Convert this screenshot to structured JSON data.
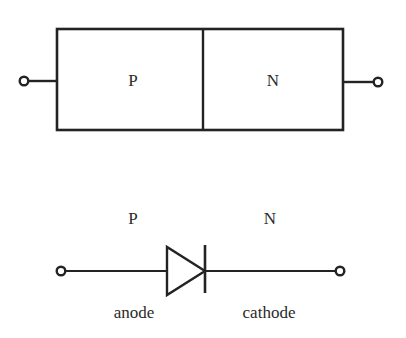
{
  "figure": {
    "background_color": "#ffffff",
    "line_color": "#232323",
    "text_color": "#2a2a2a",
    "width": 406,
    "height": 338
  },
  "structure_diagram": {
    "name": "pn-junction-block",
    "box": {
      "x": 57,
      "y": 29,
      "width": 286,
      "height": 101
    },
    "junction_line_x": 203,
    "left_region_label": "P",
    "right_region_label": "N",
    "left_terminal": {
      "cx": 24,
      "cy": 81,
      "r": 4.5
    },
    "right_terminal": {
      "cx": 378,
      "cy": 82,
      "r": 4.5
    },
    "lead_y_left": 81,
    "lead_y_right": 82
  },
  "symbol_diagram": {
    "name": "diode-symbol",
    "wire_y": 271,
    "left_terminal": {
      "cx": 61,
      "cy": 271,
      "r": 4.5
    },
    "right_terminal": {
      "cx": 340,
      "cy": 271,
      "r": 4.5
    },
    "triangle": {
      "x_back": 167,
      "x_apex": 205,
      "y_top": 247,
      "y_bottom": 295
    },
    "cathode_bar": {
      "x": 205,
      "y_top": 245,
      "y_bottom": 293
    },
    "p_label": "P",
    "n_label": "N",
    "p_label_pos": {
      "x": 133,
      "y": 224
    },
    "n_label_pos": {
      "x": 270,
      "y": 224
    },
    "anode_label": "anode",
    "cathode_label": "cathode",
    "anode_label_pos": {
      "x": 134,
      "y": 318
    },
    "cathode_label_pos": {
      "x": 269,
      "y": 318
    }
  }
}
